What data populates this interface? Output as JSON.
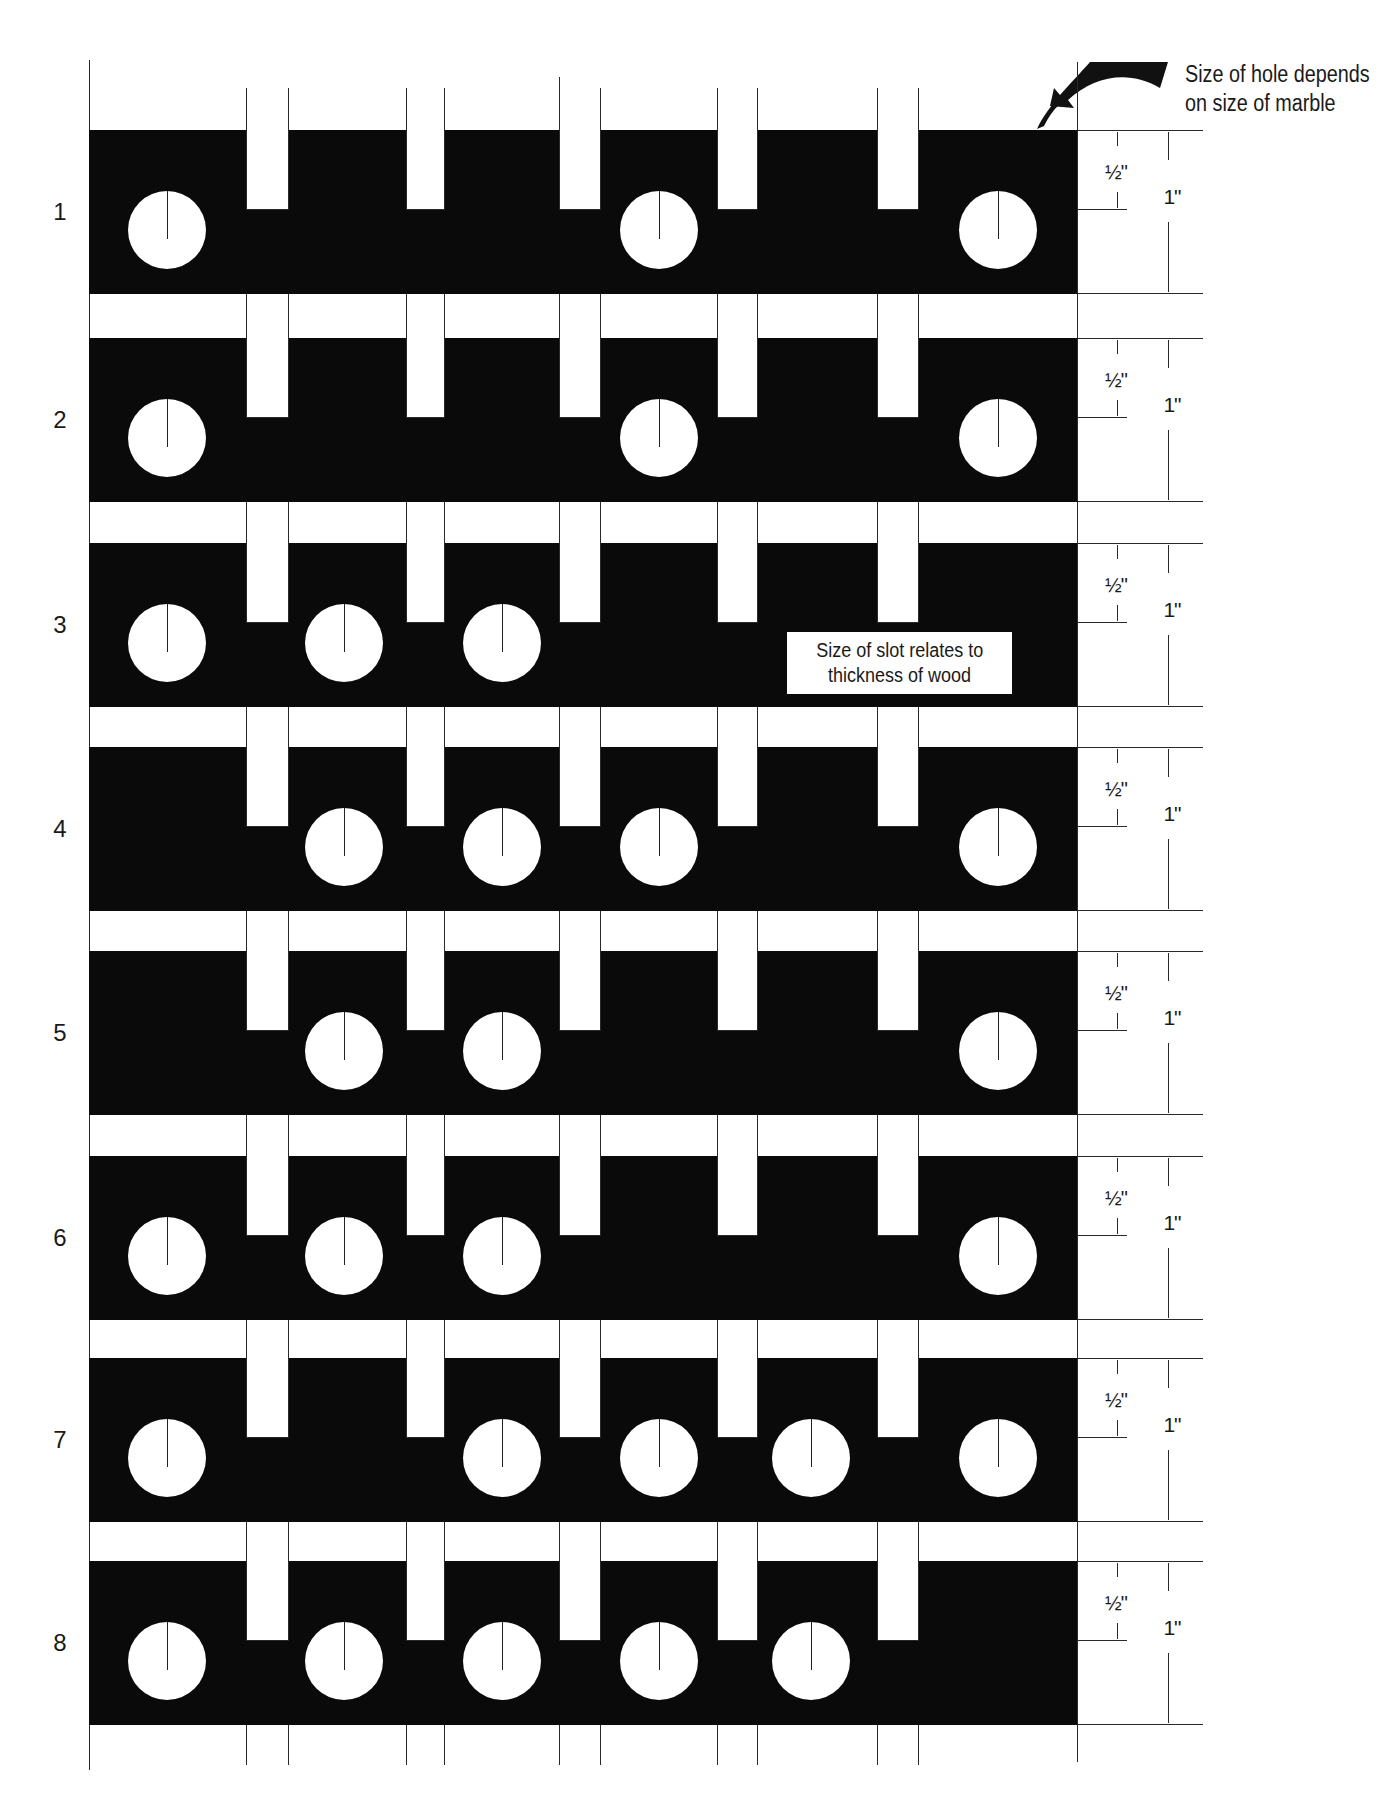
{
  "figure": {
    "callout_hole": {
      "line1": "Size of hole depends",
      "line2": "on size of marble",
      "icon": "curved-arrow-icon"
    },
    "callout_slot": {
      "line1": "Size of slot relates to",
      "line2": "thickness of wood",
      "row": 3
    },
    "dimensions": {
      "slot_depth": "½\"",
      "board_width": "1\""
    },
    "colors": {
      "board": "#0a0a0a",
      "background": "#ffffff",
      "line": "#2a2a2a"
    },
    "slot_columns": 5,
    "hole_positions": [
      "A",
      "B",
      "C",
      "D",
      "E",
      "F"
    ],
    "rows": [
      {
        "label": "1",
        "holes": [
          "A",
          "D",
          "F"
        ]
      },
      {
        "label": "2",
        "holes": [
          "A",
          "D",
          "F"
        ]
      },
      {
        "label": "3",
        "holes": [
          "A",
          "B",
          "C"
        ]
      },
      {
        "label": "4",
        "holes": [
          "B",
          "C",
          "D",
          "F"
        ]
      },
      {
        "label": "5",
        "holes": [
          "B",
          "C",
          "F"
        ]
      },
      {
        "label": "6",
        "holes": [
          "A",
          "B",
          "C",
          "F"
        ]
      },
      {
        "label": "7",
        "holes": [
          "A",
          "C",
          "D",
          "E",
          "F"
        ]
      },
      {
        "label": "8",
        "holes": [
          "A",
          "B",
          "C",
          "D",
          "E"
        ]
      }
    ]
  }
}
